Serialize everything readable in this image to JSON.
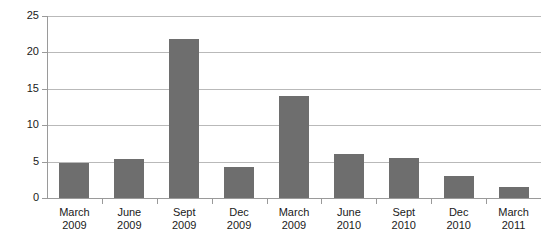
{
  "chart_data": {
    "type": "bar",
    "title": "",
    "subtitle": "",
    "xlabel": "",
    "ylabel": "",
    "ylim": [
      0,
      25
    ],
    "ytick_values": [
      0,
      5,
      10,
      15,
      20,
      25
    ],
    "ytick_labels": [
      "0",
      "5",
      "10",
      "15",
      "20",
      "25"
    ],
    "grid": "horizontal",
    "legend": "none",
    "bar_color": "#6e6e6e",
    "gridline_color": "#b9b9b9",
    "axis_color": "#9a9a9a",
    "background_color": "#ffffff",
    "categories": [
      "March 2009",
      "June 2009",
      "Sept 2009",
      "Dec 2009",
      "March 2009",
      "June 2010",
      "Sept 2010",
      "Dec 2010",
      "March 2011"
    ],
    "category_lines": [
      {
        "line1": "March",
        "line2": "2009"
      },
      {
        "line1": "June",
        "line2": "2009"
      },
      {
        "line1": "Sept",
        "line2": "2009"
      },
      {
        "line1": "Dec",
        "line2": "2009"
      },
      {
        "line1": "March",
        "line2": "2009"
      },
      {
        "line1": "June",
        "line2": "2010"
      },
      {
        "line1": "Sept",
        "line2": "2010"
      },
      {
        "line1": "Dec",
        "line2": "2010"
      },
      {
        "line1": "March",
        "line2": "2011"
      }
    ],
    "values": [
      4.8,
      5.3,
      21.8,
      4.2,
      14.0,
      6.0,
      5.5,
      3.0,
      1.5
    ]
  }
}
